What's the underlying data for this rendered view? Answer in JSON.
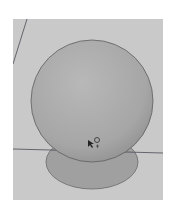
{
  "viewport": {
    "background": "#c9c9c9",
    "axis_color": "#4a4a55"
  },
  "scene": {
    "sphere": {
      "cx": 79,
      "cy": 82,
      "r": 61,
      "fill_light": "#b3b3b3",
      "fill_dark": "#8f8f8f",
      "stroke": "#5a5a5a"
    },
    "disc": {
      "cx": 79,
      "cy": 143,
      "rx": 46,
      "ry": 27,
      "fill": "#9e9e9e",
      "stroke": "#666666"
    }
  },
  "cursor": {
    "icon": "move-cursor-icon"
  }
}
